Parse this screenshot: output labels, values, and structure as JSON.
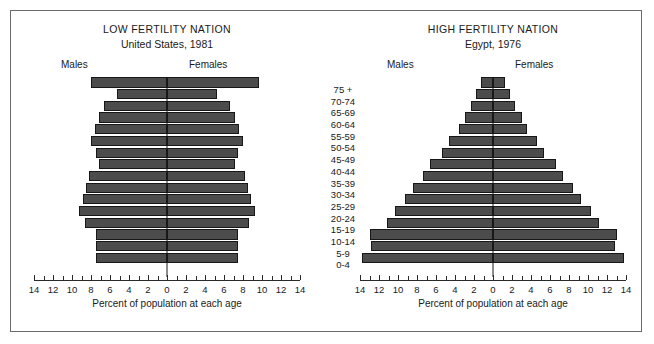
{
  "figure": {
    "border_color": "#6b6b6b",
    "bar_color": "#4c4c4c",
    "bar_edge_color": "#171717"
  },
  "age_groups": [
    "75 +",
    "70-74",
    "65-69",
    "60-64",
    "55-59",
    "50-54",
    "45-49",
    "40-44",
    "35-39",
    "30-34",
    "25-29",
    "20-24",
    "15-19",
    "10-14",
    "5-9",
    "0-4"
  ],
  "panels": {
    "left": {
      "title": "LOW FERTILITY NATION",
      "subtitle": "United States, 1981",
      "males_label": "Males",
      "females_label": "Females",
      "axis_title": "Percent of population at each age"
    },
    "right": {
      "title": "HIGH FERTILITY NATION",
      "subtitle": "Egypt, 1976",
      "males_label": "Males",
      "females_label": "Females",
      "axis_title": "Percent of population at each age"
    }
  },
  "axis": {
    "major_ticks": [
      14,
      12,
      10,
      8,
      6,
      4,
      2,
      0,
      2,
      4,
      6,
      8,
      10,
      12,
      14
    ],
    "major_values": [
      -14,
      -12,
      -10,
      -8,
      -6,
      -4,
      -2,
      0,
      2,
      4,
      6,
      8,
      10,
      12,
      14
    ],
    "minor_values": [
      -13,
      -11,
      -9,
      -7,
      -5,
      -3,
      -1,
      1,
      3,
      5,
      7,
      9,
      11,
      13
    ],
    "xlim": [
      -14,
      14
    ]
  },
  "chart_data": [
    {
      "type": "bar",
      "orientation": "horizontal-pyramid",
      "title": "LOW FERTILITY NATION",
      "subtitle": "United States, 1981",
      "xlabel": "Percent of population at each age",
      "ylabel": "",
      "xlim": [
        -14,
        14
      ],
      "grid": false,
      "legend": [
        "Males",
        "Females"
      ],
      "legend_position": "top",
      "categories": [
        "75 +",
        "70-74",
        "65-69",
        "60-64",
        "55-59",
        "50-54",
        "45-49",
        "40-44",
        "35-39",
        "30-34",
        "25-29",
        "20-24",
        "15-19",
        "10-14",
        "5-9",
        "0-4"
      ],
      "series": [
        {
          "name": "Males",
          "values": [
            8.0,
            5.3,
            6.6,
            7.2,
            7.6,
            8.0,
            7.5,
            7.2,
            8.2,
            8.5,
            8.8,
            9.3,
            8.6,
            7.5,
            7.5,
            7.5
          ]
        },
        {
          "name": "Females",
          "values": [
            9.7,
            5.3,
            6.6,
            7.2,
            7.6,
            8.0,
            7.5,
            7.2,
            8.2,
            8.5,
            8.8,
            9.3,
            8.6,
            7.5,
            7.5,
            7.5
          ]
        }
      ]
    },
    {
      "type": "bar",
      "orientation": "horizontal-pyramid",
      "title": "HIGH FERTILITY NATION",
      "subtitle": "Egypt, 1976",
      "xlabel": "Percent of population at each age",
      "ylabel": "",
      "xlim": [
        -14,
        14
      ],
      "grid": false,
      "legend": [
        "Males",
        "Females"
      ],
      "legend_position": "top",
      "categories": [
        "75 +",
        "70-74",
        "65-69",
        "60-64",
        "55-59",
        "50-54",
        "45-49",
        "40-44",
        "35-39",
        "30-34",
        "25-29",
        "20-24",
        "15-19",
        "10-14",
        "5-9",
        "0-4"
      ],
      "series": [
        {
          "name": "Males",
          "values": [
            1.3,
            1.8,
            2.3,
            3.0,
            3.6,
            4.6,
            5.4,
            6.6,
            7.4,
            8.4,
            9.3,
            10.3,
            11.2,
            13.0,
            12.8,
            13.8
          ]
        },
        {
          "name": "Females",
          "values": [
            1.3,
            1.8,
            2.3,
            3.0,
            3.6,
            4.6,
            5.4,
            6.6,
            7.4,
            8.4,
            9.3,
            10.3,
            11.2,
            13.0,
            12.8,
            13.8
          ]
        }
      ]
    }
  ]
}
